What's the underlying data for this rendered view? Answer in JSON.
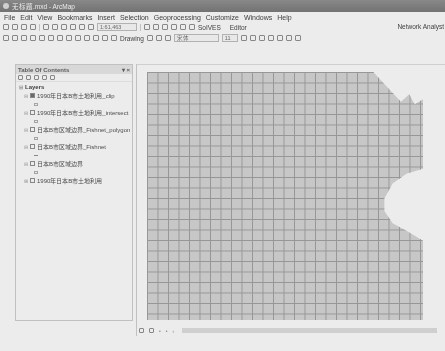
{
  "window": {
    "title": "无标题.mxd - ArcMap"
  },
  "menu": [
    "File",
    "Edit",
    "View",
    "Bookmarks",
    "Insert",
    "Selection",
    "Geoprocessing",
    "Customize",
    "Windows",
    "Help"
  ],
  "toolbar1": {
    "scale": "1:61,463",
    "solves_label": "SoIVES",
    "editor_label": "Editor",
    "network_label": "Network Analyst"
  },
  "toolbar2": {
    "drawing_label": "Drawing",
    "font_combo": "宋体",
    "size_combo": "11"
  },
  "toc": {
    "title": "Table Of Contents",
    "pin": "▾ ×",
    "root": "Layers",
    "layers": [
      {
        "name": "1990年日本B市土地利用_clip",
        "checked": true
      },
      {
        "name": "1990年日本B市土地利用_intersect",
        "checked": false
      },
      {
        "name": "日本B市区域边界_Fishnet_polygon",
        "checked": false
      },
      {
        "name": "日本B市区域边界_Fishnet",
        "checked": false
      },
      {
        "name": "日本B市区域边界",
        "checked": false
      },
      {
        "name": "1990年日本B市土地利用",
        "checked": false
      }
    ]
  },
  "map": {
    "fill_color": "#d4d4d4",
    "grid_line_color": "#9a9a9a",
    "cell_size_px": 10.5
  },
  "statusbar": {
    "icons": [
      "layout-view",
      "data-view",
      "refresh",
      "pause",
      "scroll-left"
    ]
  }
}
